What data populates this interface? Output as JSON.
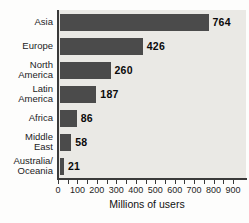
{
  "chart_data": {
    "type": "bar",
    "orientation": "horizontal",
    "title": "",
    "xlabel": "Millions of users",
    "ylabel": "",
    "xlim": [
      0,
      900
    ],
    "x_tick_values": [
      0,
      100,
      200,
      300,
      400,
      500,
      600,
      700,
      800,
      900
    ],
    "x_tick_labels": [
      "0",
      "100",
      "200",
      "300",
      "400",
      "500",
      "600",
      "700",
      "800",
      "900"
    ],
    "minor_tick_step": 50,
    "grid": false,
    "legend": false,
    "categories": [
      "Asia",
      "Europe",
      "North America",
      "Latin America",
      "Africa",
      "Middle East",
      "Australia/Oceania"
    ],
    "label_lines": [
      [
        "Asia"
      ],
      [
        "Europe"
      ],
      [
        "North",
        "America"
      ],
      [
        "Latin",
        "America"
      ],
      [
        "Africa"
      ],
      [
        "Middle",
        "East"
      ],
      [
        "Australia/",
        "Oceania"
      ]
    ],
    "values": [
      764,
      426,
      260,
      187,
      86,
      58,
      21
    ],
    "value_labels": [
      "764",
      "426",
      "260",
      "187",
      "86",
      "58",
      "21"
    ]
  },
  "colors": {
    "bar": "#4b4b4b",
    "plot_background": "#eae9e5",
    "page_background": "#fdfdfc",
    "axis": "#3a3a3a",
    "tick": "#3a3a3a",
    "label_text": "#1c1c1c",
    "value_text": "#0a0a0a"
  }
}
